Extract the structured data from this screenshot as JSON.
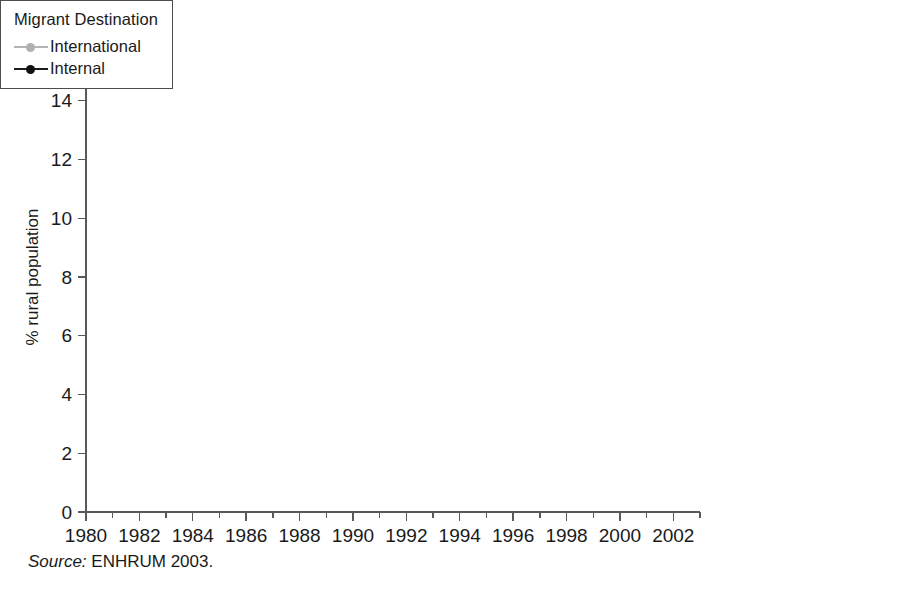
{
  "figure": {
    "source_note_label": "Source:",
    "source_note_text": " ENHRUM 2003."
  },
  "legend": {
    "title": "Migrant Destination",
    "entries": [
      {
        "label": "International",
        "color": "#b0b0b0"
      },
      {
        "label": "Internal",
        "color": "#111111"
      }
    ]
  },
  "chart_data": {
    "type": "line",
    "title": "",
    "xlabel": "",
    "ylabel": "% rural population",
    "xlim": [
      1980,
      2003
    ],
    "ylim": [
      0,
      16
    ],
    "grid": false,
    "legend_position": "right",
    "legend_title": "Migrant Destination",
    "x_tick_labels": [
      "1980",
      "1982",
      "1984",
      "1986",
      "1988",
      "1990",
      "1992",
      "1994",
      "1996",
      "1998",
      "2000",
      "2002"
    ],
    "x_tick_values": [
      1980,
      1982,
      1984,
      1986,
      1988,
      1990,
      1992,
      1994,
      1996,
      1998,
      2000,
      2002
    ],
    "x_minor_tick_values": [
      1981,
      1983,
      1985,
      1987,
      1989,
      1991,
      1993,
      1995,
      1997,
      1999,
      2001,
      2003
    ],
    "y_tick_labels": [
      "0",
      "2",
      "4",
      "6",
      "8",
      "10",
      "12",
      "14",
      "16"
    ],
    "y_tick_values": [
      0,
      2,
      4,
      6,
      8,
      10,
      12,
      14,
      16
    ],
    "x": [
      1980,
      1981,
      1982,
      1983,
      1984,
      1985,
      1986,
      1987,
      1988,
      1989,
      1990,
      1991,
      1992,
      1993,
      1994,
      1995,
      1996,
      1997,
      1998,
      1999,
      2000,
      2001,
      2002
    ],
    "series": [
      {
        "name": "International",
        "color": "#b0b0b0",
        "values": [
          4.8,
          4.9,
          5.25,
          5.15,
          5.0,
          5.5,
          5.75,
          6.05,
          6.5,
          6.3,
          7.15,
          6.9,
          7.9,
          8.0,
          8.75,
          8.95,
          9.1,
          10.0,
          10.75,
          12.1,
          13.2,
          13.5,
          14.2
        ]
      },
      {
        "name": "Internal",
        "color": "#111111",
        "values": [
          7.75,
          8.2,
          8.5,
          9.1,
          9.45,
          10.3,
          10.3,
          10.55,
          10.9,
          10.8,
          11.3,
          11.2,
          12.05,
          12.2,
          12.35,
          12.15,
          12.85,
          13.45,
          13.9,
          14.15,
          14.6,
          14.3,
          15.4
        ]
      }
    ]
  }
}
